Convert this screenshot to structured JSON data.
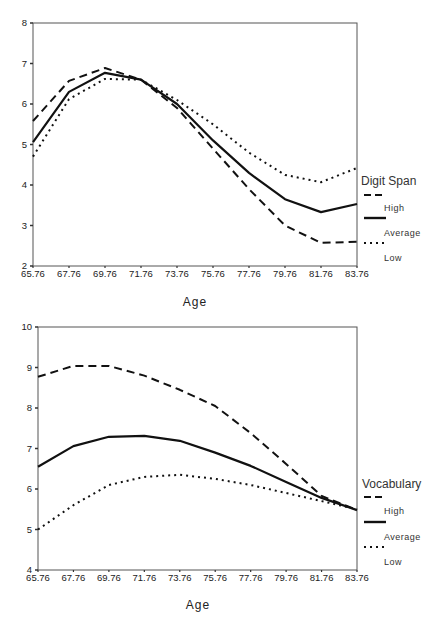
{
  "chart_data": [
    {
      "type": "line",
      "title": "",
      "xlabel": "Age",
      "ylabel": "",
      "legend_title": "Digit Span",
      "legend_position": "right",
      "grid": false,
      "x": [
        "65.76",
        "67.76",
        "69.76",
        "71.76",
        "73.76",
        "75.76",
        "77.76",
        "79.76",
        "81.76",
        "83.76"
      ],
      "yticks": [
        "2",
        "3",
        "4",
        "5",
        "6",
        "7",
        "8"
      ],
      "ylim": [
        2,
        8
      ],
      "series": [
        {
          "name": "High",
          "style": "dashed",
          "values": [
            5.58,
            6.57,
            6.89,
            6.6,
            5.9,
            4.9,
            3.9,
            3.0,
            2.57,
            2.6
          ]
        },
        {
          "name": "Average",
          "style": "solid",
          "values": [
            5.06,
            6.3,
            6.77,
            6.6,
            6.0,
            5.1,
            4.3,
            3.65,
            3.33,
            3.53
          ]
        },
        {
          "name": "Low",
          "style": "dotted",
          "values": [
            4.7,
            6.12,
            6.62,
            6.6,
            6.1,
            5.5,
            4.8,
            4.25,
            4.07,
            4.42
          ]
        }
      ]
    },
    {
      "type": "line",
      "title": "",
      "xlabel": "Age",
      "ylabel": "",
      "legend_title": "Vocabulary",
      "legend_position": "right",
      "grid": false,
      "x": [
        "65.76",
        "67.76",
        "69.76",
        "71.76",
        "73.76",
        "75.76",
        "77.76",
        "79.76",
        "81.76",
        "83.76"
      ],
      "yticks": [
        "4",
        "5",
        "6",
        "7",
        "8",
        "9",
        "10"
      ],
      "ylim": [
        4,
        10
      ],
      "series": [
        {
          "name": "High",
          "style": "dashed",
          "values": [
            8.77,
            9.04,
            9.04,
            8.8,
            8.45,
            8.05,
            7.38,
            6.62,
            5.83,
            5.48
          ]
        },
        {
          "name": "Average",
          "style": "solid",
          "values": [
            6.55,
            7.06,
            7.29,
            7.31,
            7.19,
            6.9,
            6.57,
            6.17,
            5.78,
            5.48
          ]
        },
        {
          "name": "Low",
          "style": "dotted",
          "values": [
            5.0,
            5.6,
            6.1,
            6.3,
            6.35,
            6.25,
            6.1,
            5.9,
            5.7,
            5.5
          ]
        }
      ]
    }
  ],
  "charts": [
    {
      "xlabel": "Age",
      "legend_title": "Digit Span",
      "legend": [
        "High",
        "Average",
        "Low"
      ]
    },
    {
      "xlabel": "Age",
      "legend_title": "Vocabulary",
      "legend": [
        "High",
        "Average",
        "Low"
      ]
    }
  ],
  "colors": {
    "line": "#111111",
    "axis": "#333333",
    "frame": "#555555"
  }
}
